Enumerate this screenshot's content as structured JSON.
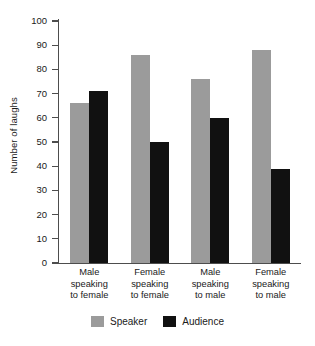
{
  "chart_data": {
    "type": "bar",
    "title": "",
    "xlabel": "",
    "ylabel": "Number of laughs",
    "ylim": [
      0,
      100
    ],
    "ytick_step": 10,
    "yticks": [
      100,
      90,
      80,
      70,
      60,
      50,
      40,
      30,
      20,
      10,
      0
    ],
    "grid": false,
    "legend_position": "bottom-center",
    "categories": [
      "Male speaking to female",
      "Female speaking to female",
      "Male speaking to male",
      "Female speaking to male"
    ],
    "category_lines": [
      [
        "Male",
        "speaking",
        "to female"
      ],
      [
        "Female",
        "speaking",
        "to female"
      ],
      [
        "Male",
        "speaking",
        "to male"
      ],
      [
        "Female",
        "speaking",
        "to male"
      ]
    ],
    "series": [
      {
        "name": "Speaker",
        "color": "#9b9b9b",
        "values": [
          66,
          86,
          76,
          88
        ]
      },
      {
        "name": "Audience",
        "color": "#111111",
        "values": [
          71,
          50,
          60,
          39
        ]
      }
    ]
  },
  "colors": {
    "speaker": "#9b9b9b",
    "audience": "#111111",
    "axis": "#4d4d4d",
    "text": "#1a1a1a",
    "background": "#ffffff"
  }
}
